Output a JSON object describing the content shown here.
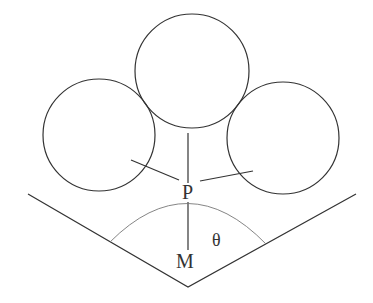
{
  "diagram": {
    "labels": {
      "point_p": "P",
      "point_m": "M",
      "angle": "θ"
    },
    "circles": [
      {
        "name": "top",
        "cx": 192,
        "cy": 71,
        "r": 57
      },
      {
        "name": "left",
        "cx": 99,
        "cy": 135,
        "r": 56
      },
      {
        "name": "right",
        "cx": 283,
        "cy": 138,
        "r": 56
      }
    ],
    "colors": {
      "stroke": "#333333",
      "arc": "#777777",
      "background": "#ffffff"
    }
  }
}
